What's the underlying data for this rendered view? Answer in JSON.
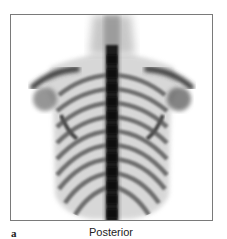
{
  "figure": {
    "panel_label": "a",
    "view_label": "Posterior",
    "image_description": "Whole-body bone scintigraphy, posterior view of thorax showing spine, ribs, scapulae and shoulders",
    "colors": {
      "uptake_dark": "#1a1a1a",
      "uptake_mid": "#7a7a7a",
      "background": "#ffffff",
      "frame_border": "#7a7a7a"
    }
  }
}
